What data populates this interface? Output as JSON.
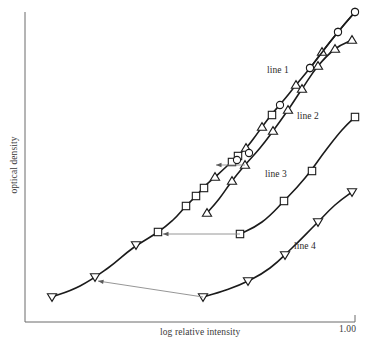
{
  "chart_data": {
    "type": "line",
    "title": "",
    "xlabel": "log relative intensity",
    "ylabel": "optical density",
    "grid": false,
    "legend_position": "inline-annotations",
    "xticks": [
      {
        "value": 1.0,
        "label": "1.00",
        "px": 355
      }
    ],
    "yticks": [],
    "axis_ranges": {
      "x_px": [
        25,
        355
      ],
      "y_px": [
        12,
        322
      ]
    },
    "series": [
      {
        "name": "main-curve",
        "label": "",
        "marker": "mixed",
        "points_px": [
          [
            52,
            297
          ],
          [
            80,
            286
          ],
          [
            108,
            268
          ],
          [
            133,
            248
          ],
          [
            158,
            232
          ],
          [
            173,
            220
          ],
          [
            186,
            206
          ],
          [
            196,
            196
          ],
          [
            205,
            186
          ],
          [
            215,
            177
          ],
          [
            226,
            167
          ],
          [
            235,
            158
          ],
          [
            246,
            148
          ],
          [
            254,
            138
          ],
          [
            262,
            127
          ],
          [
            272,
            114
          ],
          [
            283,
            101
          ],
          [
            296,
            85
          ],
          [
            310,
            68
          ],
          [
            322,
            52
          ],
          [
            338,
            32
          ],
          [
            355,
            12
          ]
        ],
        "markers_px": [
          {
            "x": 52,
            "y": 297,
            "shape": "triangle-down"
          },
          {
            "x": 95,
            "y": 277,
            "shape": "triangle-down"
          },
          {
            "x": 136,
            "y": 245,
            "shape": "triangle-down"
          },
          {
            "x": 158,
            "y": 232,
            "shape": "square"
          },
          {
            "x": 186,
            "y": 206,
            "shape": "square"
          },
          {
            "x": 196,
            "y": 196,
            "shape": "square"
          },
          {
            "x": 204,
            "y": 188,
            "shape": "square"
          },
          {
            "x": 215,
            "y": 177,
            "shape": "triangle-up"
          },
          {
            "x": 232,
            "y": 162,
            "shape": "square"
          },
          {
            "x": 238,
            "y": 156,
            "shape": "square"
          },
          {
            "x": 246,
            "y": 148,
            "shape": "triangle-up"
          },
          {
            "x": 249,
            "y": 153,
            "shape": "circle"
          },
          {
            "x": 237,
            "y": 160,
            "shape": "circle"
          },
          {
            "x": 262,
            "y": 127,
            "shape": "triangle-up"
          },
          {
            "x": 272,
            "y": 115,
            "shape": "square"
          },
          {
            "x": 280,
            "y": 105,
            "shape": "circle"
          },
          {
            "x": 296,
            "y": 85,
            "shape": "triangle-up"
          },
          {
            "x": 310,
            "y": 68,
            "shape": "circle"
          },
          {
            "x": 322,
            "y": 52,
            "shape": "triangle-up"
          },
          {
            "x": 338,
            "y": 32,
            "shape": "circle"
          },
          {
            "x": 355,
            "y": 12,
            "shape": "circle"
          }
        ]
      },
      {
        "name": "line-1",
        "label": "line 1",
        "marker": "circle",
        "label_px": [
          267,
          65
        ],
        "points_px": [
          [
            310,
            68
          ],
          [
            338,
            32
          ],
          [
            355,
            12
          ]
        ],
        "markers_px": [
          {
            "x": 310,
            "y": 68,
            "shape": "circle"
          },
          {
            "x": 338,
            "y": 32,
            "shape": "circle"
          },
          {
            "x": 355,
            "y": 12,
            "shape": "circle"
          }
        ]
      },
      {
        "name": "line-2",
        "label": "line 2",
        "marker": "triangle-up",
        "label_px": [
          297,
          111
        ],
        "points_px": [
          [
            207,
            213
          ],
          [
            219,
            199
          ],
          [
            232,
            181
          ],
          [
            245,
            165
          ],
          [
            260,
            148
          ],
          [
            273,
            131
          ],
          [
            288,
            110
          ],
          [
            302,
            89
          ],
          [
            318,
            66
          ],
          [
            335,
            49
          ],
          [
            352,
            40
          ]
        ],
        "markers_px": [
          {
            "x": 207,
            "y": 213,
            "shape": "triangle-up"
          },
          {
            "x": 232,
            "y": 181,
            "shape": "triangle-up"
          },
          {
            "x": 245,
            "y": 165,
            "shape": "triangle-up"
          },
          {
            "x": 273,
            "y": 131,
            "shape": "triangle-up"
          },
          {
            "x": 288,
            "y": 110,
            "shape": "triangle-up"
          },
          {
            "x": 302,
            "y": 89,
            "shape": "triangle-up"
          },
          {
            "x": 318,
            "y": 66,
            "shape": "triangle-up"
          },
          {
            "x": 335,
            "y": 49,
            "shape": "triangle-up"
          },
          {
            "x": 352,
            "y": 40,
            "shape": "triangle-up"
          }
        ]
      },
      {
        "name": "line-3",
        "label": "line 3",
        "marker": "square",
        "label_px": [
          265,
          169
        ],
        "points_px": [
          [
            240,
            234
          ],
          [
            262,
            222
          ],
          [
            284,
            201
          ],
          [
            305,
            178
          ],
          [
            326,
            150
          ],
          [
            342,
            130
          ],
          [
            355,
            117
          ]
        ],
        "markers_px": [
          {
            "x": 240,
            "y": 234,
            "shape": "square"
          },
          {
            "x": 284,
            "y": 201,
            "shape": "square"
          },
          {
            "x": 312,
            "y": 171,
            "shape": "square"
          },
          {
            "x": 355,
            "y": 117,
            "shape": "square"
          }
        ]
      },
      {
        "name": "line-4",
        "label": "line 4",
        "marker": "triangle-down",
        "label_px": [
          294,
          241
        ],
        "points_px": [
          [
            203,
            297
          ],
          [
            226,
            290
          ],
          [
            248,
            281
          ],
          [
            270,
            268
          ],
          [
            292,
            248
          ],
          [
            315,
            225
          ],
          [
            335,
            205
          ],
          [
            352,
            192
          ]
        ],
        "markers_px": [
          {
            "x": 203,
            "y": 297,
            "shape": "triangle-down"
          },
          {
            "x": 248,
            "y": 281,
            "shape": "triangle-down"
          },
          {
            "x": 285,
            "y": 255,
            "shape": "triangle-down"
          },
          {
            "x": 318,
            "y": 222,
            "shape": "triangle-down"
          },
          {
            "x": 352,
            "y": 192,
            "shape": "triangle-down"
          }
        ]
      }
    ],
    "annotations": [
      {
        "name": "shift-arrow-1",
        "type": "arrow-left",
        "from_px": [
          245,
          165
        ],
        "to_px": [
          216,
          165
        ]
      },
      {
        "name": "shift-arrow-2",
        "type": "arrow-left",
        "from_px": [
          240,
          234
        ],
        "to_px": [
          163,
          234
        ]
      },
      {
        "name": "shift-arrow-3",
        "type": "arrow-left",
        "from_px": [
          203,
          297
        ],
        "to_px": [
          98,
          281
        ]
      }
    ],
    "colors": {
      "curve": "#1b1b1b",
      "axis": "#6b6b6b",
      "marker_fill": "#ffffff",
      "arrow": "#8a8a8a",
      "text": "#2a2a2a",
      "background": "#ffffff"
    }
  },
  "axes": {
    "x_label": "log relative intensity",
    "y_label": "optical density",
    "x_tick_right_label": "1.00"
  },
  "series_labels": {
    "line_1": "line 1",
    "line_2": "line 2",
    "line_3": "line 3",
    "line_4": "line 4"
  }
}
